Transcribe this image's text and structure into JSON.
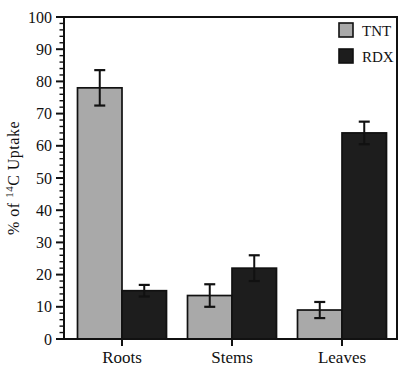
{
  "figure": {
    "ylabel": {
      "prefix": "% of ",
      "superscript": "14",
      "suffix": "C Uptake"
    }
  },
  "chart_data": {
    "type": "bar",
    "title": "",
    "xlabel": "",
    "ylabel": "% of ¹⁴C Uptake",
    "categories": [
      "Roots",
      "Stems",
      "Leaves"
    ],
    "series": [
      {
        "name": "TNT",
        "color": "#a9a9a9",
        "values": [
          78,
          13.5,
          9
        ],
        "errors": [
          5.5,
          3.5,
          2.5
        ]
      },
      {
        "name": "RDX",
        "color": "#1d1d1d",
        "values": [
          15,
          22,
          64
        ],
        "errors": [
          1.8,
          4.0,
          3.5
        ]
      }
    ],
    "ylim": [
      0,
      100
    ],
    "ytick_step": 10,
    "minor_tick_step": 2,
    "grid": false,
    "legend_position": "top-right",
    "frame_color": "#111111",
    "error_bar_color": "#111111",
    "background": "#ffffff"
  }
}
